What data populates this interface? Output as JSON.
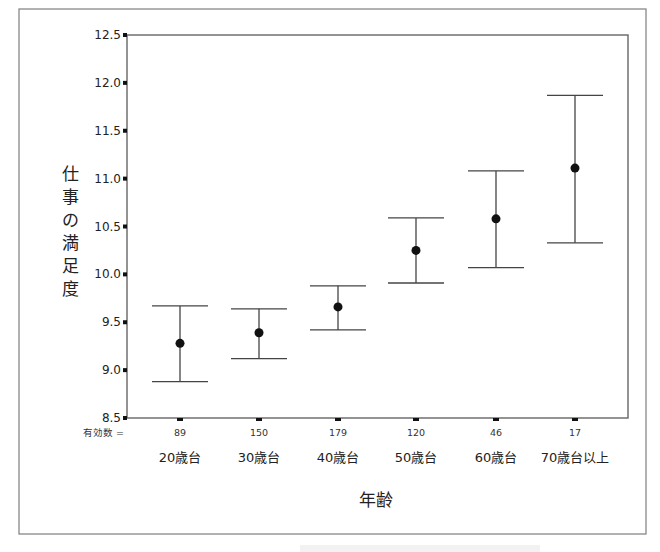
{
  "chart_data": {
    "type": "errorbar",
    "title": "",
    "xlabel": "年齢",
    "ylabel": "仕事の満足度",
    "ylim": [
      8.5,
      12.5
    ],
    "yticks": [
      "8.5",
      "9.0",
      "9.5",
      "10.0",
      "10.5",
      "11.0",
      "11.5",
      "12.0",
      "12.5"
    ],
    "grid": false,
    "legend": null,
    "n_prefix": "有効数 =",
    "categories": [
      "20歳台",
      "30歳台",
      "40歳台",
      "50歳台",
      "60歳台",
      "70歳台以上"
    ],
    "n": [
      "89",
      "150",
      "179",
      "120",
      "46",
      "17"
    ],
    "series": [
      {
        "name": "仕事の満足度",
        "mean": [
          9.28,
          9.39,
          9.66,
          10.25,
          10.58,
          11.11
        ],
        "upper": [
          9.67,
          9.64,
          9.88,
          10.59,
          11.08,
          11.87
        ],
        "lower": [
          8.88,
          9.12,
          9.42,
          9.91,
          10.07,
          10.33
        ]
      }
    ]
  },
  "colors": {
    "line": "#444444",
    "marker": "#111111",
    "frame": "#666666",
    "outer_frame": "#888888"
  }
}
